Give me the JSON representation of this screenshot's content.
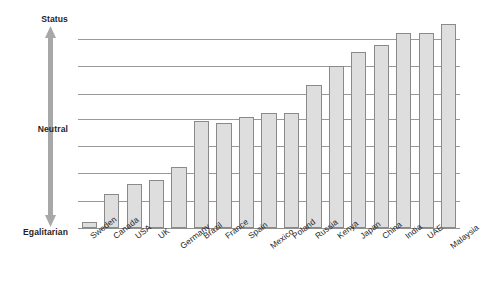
{
  "axis": {
    "top_label": "Status",
    "middle_label": "Neutral",
    "bottom_label": "Egalitarian",
    "arrow_color": "#a8a8a8"
  },
  "style": {
    "bar_fill": "#dedede",
    "bar_stroke": "#8a8a8a",
    "gridline_color": "#9a9a9a",
    "background": "#ffffff"
  },
  "chart_data": {
    "type": "bar",
    "title": "",
    "subtitle": "",
    "xlabel": "",
    "ylabel": "Status orientation",
    "ylim": [
      0,
      100
    ],
    "grid": true,
    "legend": false,
    "y_axis_ticks": [
      "Egalitarian",
      "Neutral",
      "Status"
    ],
    "y_tick_values": [
      0,
      50,
      100
    ],
    "gridline_values": [
      13,
      26,
      39,
      52,
      64,
      77,
      90
    ],
    "categories": [
      "Sweden",
      "Canada",
      "USA",
      "UK",
      "Germany",
      "Brazil",
      "France",
      "Spain",
      "Mexico",
      "Poland",
      "Russia",
      "Kenya",
      "Japan",
      "China",
      "India",
      "UAE",
      "Malaysia"
    ],
    "values": [
      3,
      16,
      21,
      23,
      29,
      51,
      50,
      53,
      55,
      55,
      68,
      77,
      84,
      87,
      93,
      93,
      97
    ],
    "annotations": []
  },
  "labels": {
    "ticks": [
      {
        "text": "Sweden",
        "drop": false
      },
      {
        "text": "Canada",
        "drop": false
      },
      {
        "text": "USA",
        "drop": false
      },
      {
        "text": "UK",
        "drop": false
      },
      {
        "text": "Germany",
        "drop": true
      },
      {
        "text": "Brazil",
        "drop": false
      },
      {
        "text": "France",
        "drop": false
      },
      {
        "text": "Spain",
        "drop": false
      },
      {
        "text": "Mexico",
        "drop": true
      },
      {
        "text": "Poland",
        "drop": false
      },
      {
        "text": "Russia",
        "drop": false
      },
      {
        "text": "Kenya",
        "drop": false
      },
      {
        "text": "Japan",
        "drop": false
      },
      {
        "text": "China",
        "drop": false
      },
      {
        "text": "India",
        "drop": false
      },
      {
        "text": "UAE",
        "drop": false
      },
      {
        "text": "Malaysia",
        "drop": true
      }
    ]
  }
}
